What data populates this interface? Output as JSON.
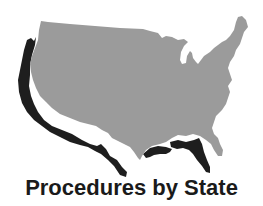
{
  "caption": "Procedures by State",
  "graphic": {
    "subject": "United States map",
    "icon": "us-map-icon",
    "colors": {
      "map_fill": "#9b9b9b",
      "shadow_fill": "#1e1e1e",
      "background": "#ffffff",
      "caption_text": "#1a1a1a"
    }
  }
}
